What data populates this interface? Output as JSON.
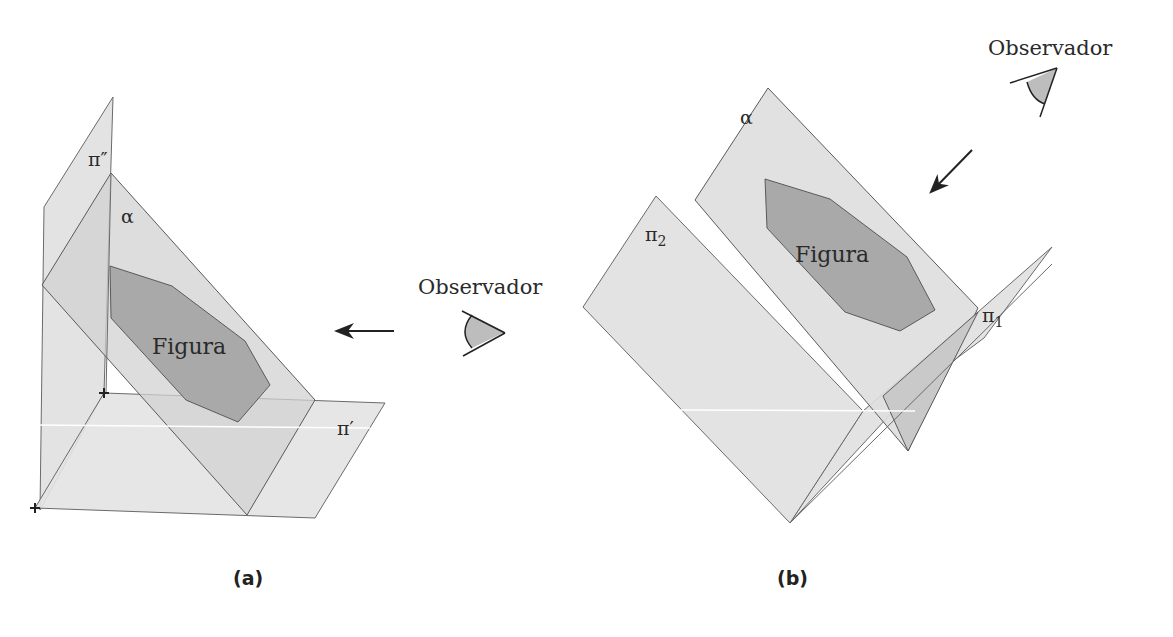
{
  "diagram_a": {
    "caption": "(a)",
    "planes": {
      "back_vertical": "π″",
      "horizontal": "π′",
      "oblique": "α"
    },
    "figure_label": "Figura",
    "observer_label": "Observador",
    "arrow_direction": "left"
  },
  "diagram_b": {
    "caption": "(b)",
    "planes": {
      "oblique": "α",
      "plane_2": "π",
      "plane_2_sub": "2",
      "plane_1": "π",
      "plane_1_sub": "1"
    },
    "figure_label": "Figura",
    "observer_label": "Observador",
    "arrow_direction": "down-left"
  },
  "colors": {
    "plane_fill": "#e3e3e3",
    "plane_overlap_fill": "#cfcfcf",
    "figure_fill": "#a9a9a9",
    "edge": "#5a5a5a",
    "eye_fill": "#bdbdbd"
  }
}
